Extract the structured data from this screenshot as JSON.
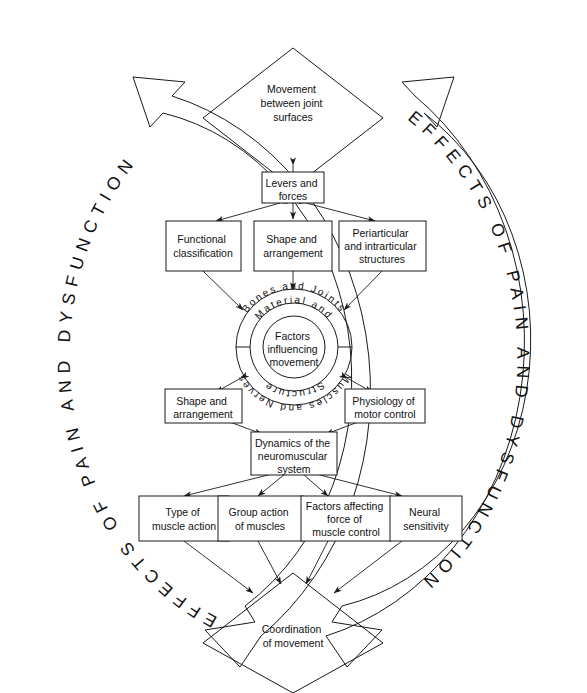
{
  "diagram": {
    "outer_band": {
      "left_label": "EFFECTS OF PAIN AND DYSFUNCTION",
      "right_label": "EFFECTS OF PAIN AND DYSFUNCTION"
    },
    "nodes": {
      "top_diamond": {
        "lines": [
          "Movement",
          "between joint",
          "surfaces"
        ]
      },
      "bottom_diamond": {
        "lines": [
          "Coordination",
          "of movement"
        ]
      },
      "levers": {
        "lines": [
          "Levers and",
          "forces"
        ]
      },
      "functional_classification": {
        "lines": [
          "Functional",
          "classification"
        ]
      },
      "shape_arrangement_upper": {
        "lines": [
          "Shape and",
          "arrangement"
        ]
      },
      "periarticular": {
        "lines": [
          "Periarticular",
          "and intrarticular",
          "structures"
        ]
      },
      "shape_arrangement_lower": {
        "lines": [
          "Shape and",
          "arrangement"
        ]
      },
      "physiology": {
        "lines": [
          "Physiology of",
          "motor control"
        ]
      },
      "dynamics": {
        "lines": [
          "Dynamics of the",
          "neuromuscular",
          "system"
        ]
      },
      "type_of_muscle_action": {
        "lines": [
          "Type of",
          "muscle action"
        ]
      },
      "group_action": {
        "lines": [
          "Group action",
          "of muscles"
        ]
      },
      "factors_affecting_force": {
        "lines": [
          "Factors affecting",
          "force of",
          "muscle control"
        ]
      },
      "neural_sensitivity": {
        "lines": [
          "Neural",
          "sensitivity"
        ]
      }
    },
    "core": {
      "outer_ring_top": "Bones and Joints",
      "outer_ring_bottom": "Muscles and Nerves",
      "inner_ring_top": "Material and",
      "inner_ring_bottom": "Structure",
      "center_lines": [
        "Factors",
        "influencing",
        "movement"
      ]
    },
    "colors": {
      "stroke": "#1a1a1a",
      "background": "#ffffff",
      "text": "#111111"
    }
  }
}
